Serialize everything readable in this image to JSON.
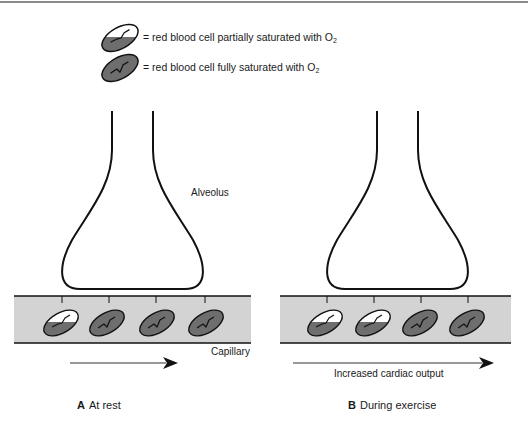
{
  "figure": {
    "top_rule_color": "#7a7a7a",
    "legend": [
      {
        "icon": "rbc-partially-saturated-icon",
        "text": "= red blood cell partially saturated with O",
        "subscript": "2"
      },
      {
        "icon": "rbc-fully-saturated-icon",
        "text": "= red blood cell fully saturated with O",
        "subscript": "2"
      }
    ],
    "labels": {
      "alveolus": "Alveolus",
      "capillary": "Capillary",
      "increased_cardiac_output": "Increased cardiac output"
    },
    "panels": [
      {
        "letter": "A",
        "title": "At rest",
        "cells": [
          "partial",
          "full",
          "full",
          "full"
        ]
      },
      {
        "letter": "B",
        "title": "During exercise",
        "cells": [
          "partial",
          "partial",
          "full",
          "full"
        ]
      }
    ],
    "colors": {
      "capillary_fill": "#d3d3d3",
      "cell_fill": "#6e6e6e",
      "cell_partial_top": "#ffffff",
      "outline": "#111111"
    }
  }
}
